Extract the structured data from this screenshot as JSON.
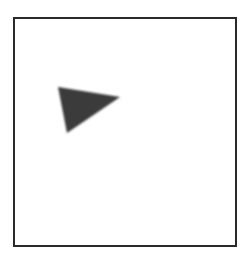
{
  "figure": {
    "frame": {
      "stroke": "#2a2a2a",
      "fill": "#ffffff"
    },
    "shape": {
      "type": "triangle",
      "fill": "#3a3a3a",
      "points": "58,87 120,97 67,133"
    }
  }
}
